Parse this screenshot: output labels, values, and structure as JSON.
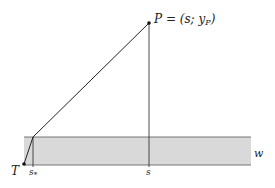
{
  "diagram": {
    "colors": {
      "background": "#ffffff",
      "band_fill": "#d9d9d9",
      "line": "#222222"
    },
    "labels": {
      "point_p": "P = (s; y",
      "point_p_sub": "P",
      "point_p_close": ")",
      "point_t": "T",
      "s_star": "s",
      "s_star_sub": "*",
      "s": "s",
      "w": "w"
    },
    "geometry": {
      "band": {
        "x1": 24,
        "x2": 251,
        "y_top": 137,
        "y_bottom": 165
      },
      "P": {
        "x": 149,
        "y": 23
      },
      "T": {
        "x": 24,
        "y": 164
      },
      "kink": {
        "x": 33,
        "y": 137
      },
      "s_star_x": 33,
      "s_x": 149
    }
  }
}
